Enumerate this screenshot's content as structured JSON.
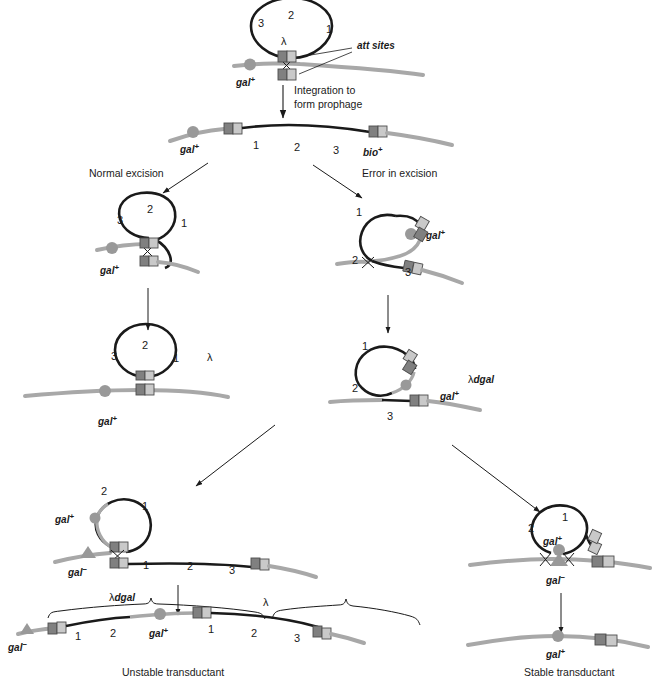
{
  "figure": {
    "colors": {
      "host_dna": "#a8a8a8",
      "phage_dna": "#1a1a1a",
      "att_dark": "#808080",
      "att_light": "#c9c9c9",
      "marker_gray": "#999999",
      "text": "#1a1a1a"
    }
  },
  "stage1": {
    "name": "Circular lambda genome aligning with host chromosome",
    "circle_numbers": [
      "3",
      "2",
      "1"
    ],
    "lambda_label": "λ",
    "att_callout": "att sites",
    "host_marker": "gal",
    "host_marker_sup": "+"
  },
  "arrow1": {
    "line1": "Integration to",
    "line2": "form prophage"
  },
  "stage2": {
    "name": "Integrated prophage in host chromosome",
    "left_marker": "gal",
    "left_marker_sup": "+",
    "right_marker": "bio",
    "right_marker_sup": "+",
    "segments": [
      "1",
      "2",
      "3"
    ]
  },
  "branches": {
    "left_label": "Normal excision",
    "right_label": "Error in excision"
  },
  "stage3_left": {
    "name": "Normal excision looping out",
    "circle_numbers": [
      "3",
      "2",
      "1"
    ],
    "host_marker": "gal",
    "host_marker_sup": "+"
  },
  "stage3_right": {
    "name": "Aberrant excision looping out including gal",
    "circle_numbers": [
      "1",
      "2",
      "3"
    ],
    "gal_label": "gal",
    "gal_sup": "+"
  },
  "stage4_left": {
    "name": "Excised normal lambda phage",
    "circle_numbers": [
      "3",
      "2",
      "1"
    ],
    "lambda_label": "λ",
    "host_marker": "gal",
    "host_marker_sup": "+"
  },
  "stage4_right": {
    "name": "Excised lambda dgal transducing particle",
    "circle_numbers": [
      "1",
      "2"
    ],
    "chromosome_number": "3",
    "phage_label": "λdgal",
    "gal_label": "gal",
    "gal_sup": "+"
  },
  "stage5_left": {
    "name": "Unstable transductant integration intermediate",
    "circle_numbers": [
      "2",
      "1"
    ],
    "circle_gal": "gal",
    "circle_gal_sup": "+",
    "host_gal": "gal",
    "host_gal_sup": "−",
    "segments": [
      "1",
      "2",
      "3"
    ]
  },
  "stage5_right": {
    "name": "Stable transductant double crossover recombination",
    "circle_numbers": [
      "2",
      "1"
    ],
    "circle_gal": "gal",
    "circle_gal_sup": "+",
    "host_gal": "gal",
    "host_gal_sup": "−"
  },
  "stage6_left": {
    "name": "Unstable transductant final chromosome",
    "brace_left": "λdgal",
    "brace_right": "λ",
    "far_left_marker": "gal",
    "far_left_sup": "−",
    "mid_marker": "gal",
    "mid_sup": "+",
    "segments_left": [
      "1",
      "2"
    ],
    "segments_right": [
      "1",
      "2",
      "3"
    ],
    "caption": "Unstable transductant"
  },
  "stage6_right": {
    "name": "Stable transductant final chromosome",
    "marker": "gal",
    "marker_sup": "+",
    "caption": "Stable transductant"
  }
}
